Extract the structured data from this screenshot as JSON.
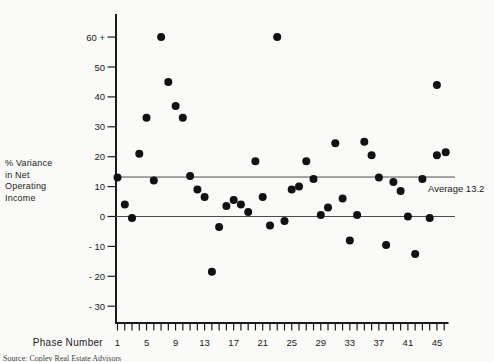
{
  "source": "Source: Copley Real Estate Advisors",
  "chart_data": {
    "type": "scatter",
    "title": "",
    "xlabel": "Phase Number",
    "ylabel_lines": [
      "% Variance",
      "in Net",
      "Operating",
      "Income"
    ],
    "x_range": [
      1,
      46
    ],
    "x_tick_labels": [
      1,
      5,
      9,
      13,
      17,
      21,
      25,
      29,
      33,
      37,
      41,
      45
    ],
    "y_ticks": [
      60,
      50,
      40,
      30,
      20,
      10,
      0,
      -10,
      -20,
      -30
    ],
    "y_tick_labels": [
      "60 +",
      "50",
      "40",
      "30",
      "20",
      "10",
      "0",
      "- 10",
      "- 20",
      "- 30"
    ],
    "ylim": [
      -35,
      68
    ],
    "grid": false,
    "dot_color": "#111111",
    "axis_color": "#1a1a1a",
    "refline_color": "#4d4d4d",
    "zero_line": 0,
    "average_line": {
      "value": 13.2,
      "label": "Average 13.2"
    },
    "points": [
      {
        "x": 1,
        "y": 13
      },
      {
        "x": 2,
        "y": 4
      },
      {
        "x": 3,
        "y": -0.5
      },
      {
        "x": 4,
        "y": 21
      },
      {
        "x": 5,
        "y": 33
      },
      {
        "x": 6,
        "y": 12
      },
      {
        "x": 7,
        "y": 60
      },
      {
        "x": 8,
        "y": 45
      },
      {
        "x": 9,
        "y": 37
      },
      {
        "x": 10,
        "y": 33
      },
      {
        "x": 11,
        "y": 13.5
      },
      {
        "x": 12,
        "y": 9
      },
      {
        "x": 13,
        "y": 6.5
      },
      {
        "x": 14,
        "y": -18.5
      },
      {
        "x": 15,
        "y": -3.5
      },
      {
        "x": 16,
        "y": 3.5
      },
      {
        "x": 17,
        "y": 5.5
      },
      {
        "x": 18,
        "y": 4
      },
      {
        "x": 19,
        "y": 1.5
      },
      {
        "x": 20,
        "y": 18.5
      },
      {
        "x": 21,
        "y": 6.5
      },
      {
        "x": 22,
        "y": -3
      },
      {
        "x": 23,
        "y": 60
      },
      {
        "x": 24,
        "y": -1.5
      },
      {
        "x": 25,
        "y": 9
      },
      {
        "x": 26,
        "y": 10
      },
      {
        "x": 27,
        "y": 18.5
      },
      {
        "x": 28,
        "y": 12.5
      },
      {
        "x": 29,
        "y": 0.5
      },
      {
        "x": 30,
        "y": 3
      },
      {
        "x": 31,
        "y": 24.5
      },
      {
        "x": 32,
        "y": 6
      },
      {
        "x": 33,
        "y": -8
      },
      {
        "x": 34,
        "y": 0.5
      },
      {
        "x": 35,
        "y": 25
      },
      {
        "x": 36,
        "y": 20.5
      },
      {
        "x": 37,
        "y": 13
      },
      {
        "x": 38,
        "y": -9.5
      },
      {
        "x": 39,
        "y": 11.5
      },
      {
        "x": 40,
        "y": 8.5
      },
      {
        "x": 41,
        "y": 0
      },
      {
        "x": 42,
        "y": -12.5
      },
      {
        "x": 43,
        "y": 12.5
      },
      {
        "x": 44,
        "y": -0.5
      },
      {
        "x": 45,
        "y": 44
      },
      {
        "x": 45,
        "y": 20.5
      },
      {
        "x": 46.2,
        "y": 21.5
      }
    ]
  }
}
